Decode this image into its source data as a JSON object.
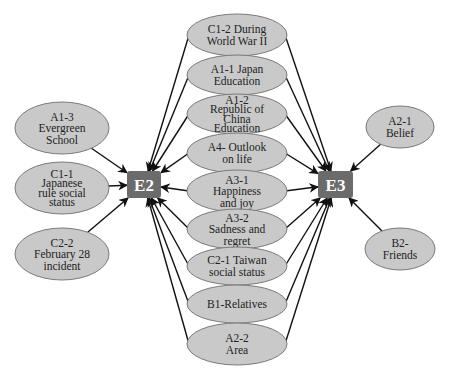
{
  "hubs": [
    {
      "id": "E2",
      "label": "E2",
      "x": 127,
      "y": 171,
      "w": 34,
      "h": 27
    },
    {
      "id": "E3",
      "label": "E3",
      "x": 318,
      "y": 171,
      "w": 35,
      "h": 27
    }
  ],
  "nodes": [
    {
      "id": "C1-2",
      "lines": [
        "C1-2 During",
        "World War II"
      ],
      "cx": 237,
      "cy": 35,
      "rx": 50,
      "ry": 21,
      "targets": [
        "E2",
        "E3"
      ]
    },
    {
      "id": "A1-1",
      "lines": [
        "A1-1 Japan",
        "Education"
      ],
      "cx": 237,
      "cy": 75,
      "rx": 50,
      "ry": 20,
      "targets": [
        "E2",
        "E3"
      ]
    },
    {
      "id": "A1-2",
      "lines": [
        "A1-2",
        "Republic of",
        "China",
        "Education"
      ],
      "cx": 237,
      "cy": 114,
      "rx": 50,
      "ry": 20,
      "targets": [
        "E2",
        "E3"
      ]
    },
    {
      "id": "A4",
      "lines": [
        "A4- Outlook",
        "on life"
      ],
      "cx": 237,
      "cy": 153,
      "rx": 50,
      "ry": 20,
      "targets": [
        "E2",
        "E3"
      ]
    },
    {
      "id": "A3-1",
      "lines": [
        "A3-1",
        "Happiness",
        "and joy"
      ],
      "cx": 237,
      "cy": 191,
      "rx": 50,
      "ry": 21,
      "targets": [
        "E2",
        "E3"
      ]
    },
    {
      "id": "A3-2",
      "lines": [
        "A3-2",
        "Sadness and",
        "regret"
      ],
      "cx": 237,
      "cy": 229,
      "rx": 50,
      "ry": 20,
      "targets": [
        "E2",
        "E3"
      ]
    },
    {
      "id": "C2-1",
      "lines": [
        "C2-1 Taiwan",
        "social status"
      ],
      "cx": 237,
      "cy": 266,
      "rx": 50,
      "ry": 19,
      "targets": [
        "E2",
        "E3"
      ]
    },
    {
      "id": "B1",
      "lines": [
        "B1-Relatives"
      ],
      "cx": 237,
      "cy": 304,
      "rx": 50,
      "ry": 19,
      "targets": [
        "E2",
        "E3"
      ]
    },
    {
      "id": "A2-2",
      "lines": [
        "A2-2",
        "Area"
      ],
      "cx": 237,
      "cy": 344,
      "rx": 50,
      "ry": 21,
      "targets": [
        "E2",
        "E3"
      ]
    },
    {
      "id": "A1-3",
      "lines": [
        "A1-3",
        "Evergreen",
        "School"
      ],
      "cx": 62,
      "cy": 128,
      "rx": 47,
      "ry": 26,
      "targets": [
        "E2"
      ]
    },
    {
      "id": "C1-1",
      "lines": [
        "C1-1",
        "Japanese",
        "rule social",
        "status"
      ],
      "cx": 62,
      "cy": 188,
      "rx": 47,
      "ry": 26,
      "targets": [
        "E2"
      ]
    },
    {
      "id": "C2-2",
      "lines": [
        "C2-2",
        "February 28",
        "incident"
      ],
      "cx": 62,
      "cy": 254,
      "rx": 47,
      "ry": 26,
      "targets": [
        "E2"
      ]
    },
    {
      "id": "A2-1",
      "lines": [
        "A2-1",
        "Belief"
      ],
      "cx": 400,
      "cy": 127,
      "rx": 34,
      "ry": 21,
      "targets": [
        "E3"
      ]
    },
    {
      "id": "B2",
      "lines": [
        "B2-",
        "Friends"
      ],
      "cx": 400,
      "cy": 249,
      "rx": 35,
      "ry": 21,
      "targets": [
        "E3"
      ]
    }
  ],
  "colors": {
    "ellipse_fill": "#c9c9c9",
    "ellipse_stroke": "#7a7a7a",
    "hub_fill": "#6b6b6b",
    "hub_text": "#ffffff",
    "edge": "#111111"
  }
}
